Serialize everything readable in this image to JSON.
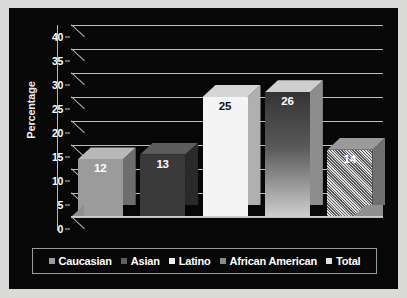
{
  "chart_data": {
    "type": "bar",
    "title": "",
    "subtitle": "",
    "xlabel": "",
    "ylabel": "Percentage",
    "categories": [
      "Caucasian",
      "Asian",
      "Latino",
      "African American",
      "Total"
    ],
    "values": [
      12,
      13,
      25,
      26,
      14
    ],
    "value_labels": [
      "12",
      "13",
      "25",
      "26",
      "14"
    ],
    "ylim": [
      0,
      40
    ],
    "y_ticks": [
      "40",
      "35",
      "30",
      "25",
      "20",
      "15",
      "10",
      "5",
      "0"
    ],
    "y_tick_values": [
      40,
      35,
      30,
      25,
      20,
      15,
      10,
      5,
      0
    ],
    "grid": true,
    "legend_position": "bottom",
    "style": "3d-column",
    "background_color": "#070707",
    "grid_color": "#bdbdbd",
    "series": [
      {
        "name": "Percentage",
        "values": [
          12,
          13,
          25,
          26,
          14
        ]
      }
    ],
    "bar_styles": [
      {
        "name": "Caucasian",
        "fill": "#9b9b9b",
        "top": "#b8b8b8",
        "side": "#6e6e6e",
        "label_color": "#ffffff",
        "pattern": "solid"
      },
      {
        "name": "Asian",
        "fill": "#3a3a3a",
        "top": "#5c5c5c",
        "side": "#2a2a2a",
        "label_color": "#ffffff",
        "pattern": "solid"
      },
      {
        "name": "Latino",
        "fill": "#f4f4f4",
        "top": "#d5d5d5",
        "side": "#b0b0b0",
        "label_color": "#111111",
        "pattern": "solid"
      },
      {
        "name": "African American",
        "fill": "#343434",
        "top": "#cfcfcf",
        "side": "#8d8d8d",
        "label_color": "#ffffff",
        "pattern": "gradient"
      },
      {
        "name": "Total",
        "fill": "#dcdcdc",
        "top": "#9a9a9a",
        "side": "#707070",
        "label_color": "#ffffff",
        "pattern": "diagonal-hatch"
      }
    ]
  },
  "legend": {
    "items": [
      {
        "label": "Caucasian",
        "color": "#9b9b9b"
      },
      {
        "label": "Asian",
        "color": "#5f5f5f"
      },
      {
        "label": "Latino",
        "color": "#f2f2f2"
      },
      {
        "label": "African American",
        "color": "#8a8a8a"
      },
      {
        "label": "Total",
        "color": "#e2e2e2"
      }
    ]
  }
}
